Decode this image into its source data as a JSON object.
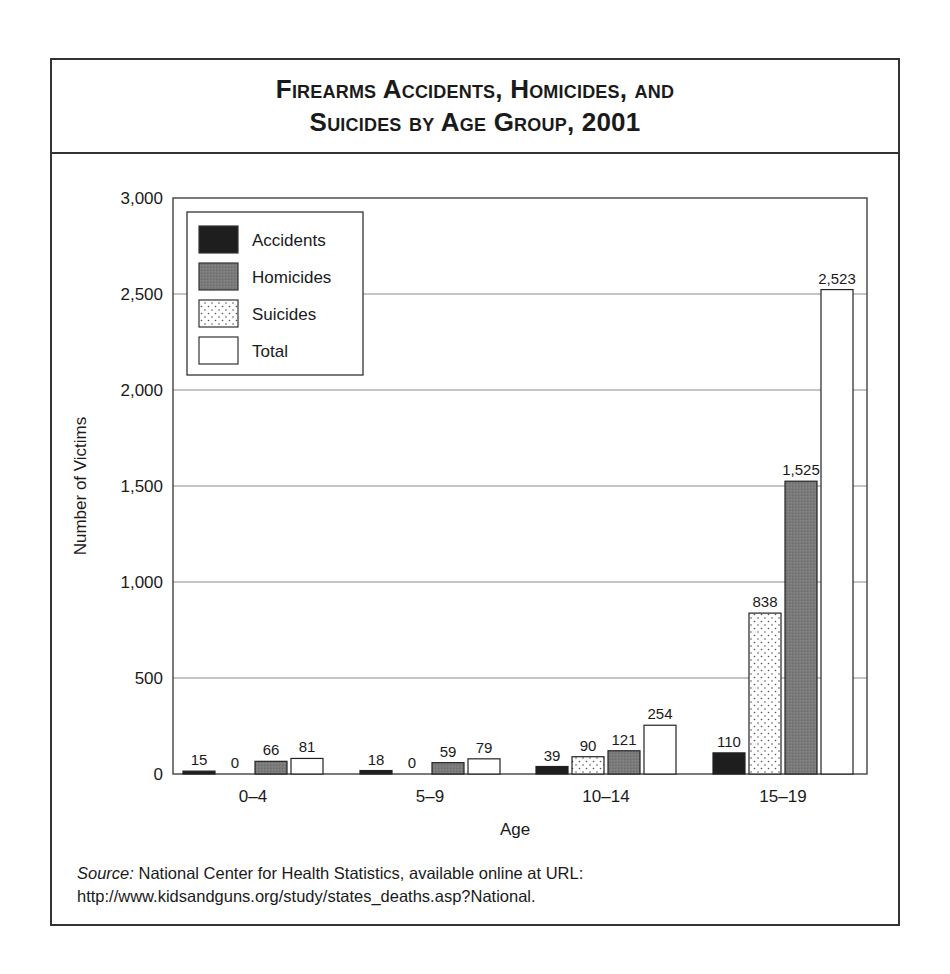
{
  "title": {
    "line1": "Firearms Accidents, Homicides, and",
    "line2": "Suicides by Age Group, 2001"
  },
  "source": {
    "label": "Source:",
    "text": " National Center for Health Statistics, available online at URL: http://www.kidsandguns.org/study/states_deaths.asp?National."
  },
  "colors": {
    "accidents": "#1e1e1e",
    "homicides": "#7a7a7a",
    "suicides": "#ffffff",
    "total": "#ffffff",
    "gridline": "#888888"
  },
  "chart_data": {
    "type": "bar",
    "title": "Firearms Accidents, Homicides, and Suicides by Age Group, 2001",
    "xlabel": "Age",
    "ylabel": "Number of Victims",
    "categories": [
      "0–4",
      "5–9",
      "10–14",
      "15–19"
    ],
    "bar_order": [
      "Accidents",
      "Suicides",
      "Homicides",
      "Total"
    ],
    "series": [
      {
        "name": "Accidents",
        "values": [
          15,
          18,
          39,
          110
        ]
      },
      {
        "name": "Homicides",
        "values": [
          66,
          59,
          121,
          1525
        ]
      },
      {
        "name": "Suicides",
        "values": [
          0,
          0,
          90,
          838
        ]
      },
      {
        "name": "Total",
        "values": [
          81,
          79,
          254,
          2523
        ]
      }
    ],
    "value_labels": [
      [
        "15",
        "0",
        "66",
        "81"
      ],
      [
        "18",
        "0",
        "59",
        "79"
      ],
      [
        "39",
        "90",
        "121",
        "254"
      ],
      [
        "110",
        "838",
        "1,525",
        "2,523"
      ]
    ],
    "ylim": [
      0,
      3000
    ],
    "yticks": [
      0,
      500,
      1000,
      1500,
      2000,
      2500,
      3000
    ],
    "ytick_labels": [
      "0",
      "500",
      "1,000",
      "1,500",
      "2,000",
      "2,500",
      "3,000"
    ],
    "grid": true,
    "legend": {
      "position": "upper left",
      "entries": [
        "Accidents",
        "Homicides",
        "Suicides",
        "Total"
      ]
    }
  }
}
